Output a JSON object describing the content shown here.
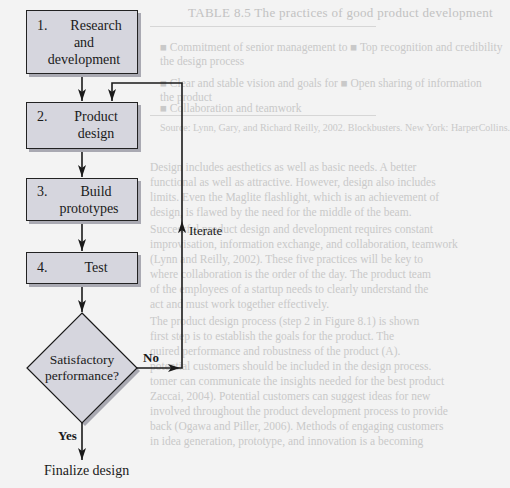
{
  "diagram": {
    "type": "flowchart",
    "steps": [
      {
        "number": "1.",
        "label_lines": [
          "Research",
          "and",
          "development"
        ]
      },
      {
        "number": "2.",
        "label_lines": [
          "Product",
          "design"
        ]
      },
      {
        "number": "3.",
        "label_lines": [
          "Build",
          "prototypes"
        ]
      },
      {
        "number": "4.",
        "label_lines": [
          "Test"
        ]
      }
    ],
    "decision": {
      "label_lines": [
        "Satisfactory",
        "performance?"
      ]
    },
    "edges": {
      "no_label": "No",
      "yes_label": "Yes",
      "iterate_label": "Iterate"
    },
    "end": {
      "label": "Finalize design"
    },
    "colors": {
      "box_fill": "#d6d6de",
      "box_shadow": "#a9a9b2",
      "stroke": "#1a1a1a",
      "background": "#f3f3f3"
    }
  },
  "background_page": {
    "table_title": "TABLE 8.5 The practices of good product development",
    "table_lines": [
      "■  Commitment of senior management to    ■  Top recognition and credibility",
      "    the design process",
      "■  Clear and stable vision and goals for     ■  Open sharing of information",
      "    the product",
      "                                                        ■  Collaboration and teamwork"
    ],
    "source": "Source: Lynn, Gary, and Richard Reilly, 2002. Blockbusters. New York: HarperCollins.",
    "paragraphs": [
      "    Design includes aesthetics as well as basic needs. A better",
      "functional as well as attractive. However, design also includes",
      "limits. Even the Maglite flashlight, which is an achievement of",
      "design, is flawed by the need for the middle of the beam.",
      "    Successful product design and development requires constant",
      "improvisation, information exchange, and collaboration, teamwork",
      "(Lynn and Reilly, 2002). These five practices will be key to",
      "where collaboration is the order of the day. The product team",
      "of the employees of a startup needs to clearly understand the",
      "act and must work together effectively.",
      "    The product design process (step 2 in Figure 8.1) is shown",
      "first step is to establish the goals for the product. The",
      "quired performance and robustness of the product (A).",
      "potential customers should be included in the design process.",
      "tomer can communicate the insights needed for the best product",
      "Zaccai, 2004). Potential customers can suggest ideas for new",
      "involved throughout the product development process to provide",
      "back (Ogawa and Piller, 2006). Methods of engaging customers",
      "in idea generation, prototype, and innovation is a becoming"
    ]
  }
}
